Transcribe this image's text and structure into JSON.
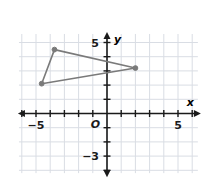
{
  "chart_data": {
    "type": "scatter",
    "title": "",
    "xlabel": "x",
    "ylabel": "y",
    "grid": true,
    "legend": false,
    "xlim": [
      -6.2,
      6.4
    ],
    "ylim": [
      -4.2,
      5.6
    ],
    "x_tick_labels": [
      {
        "value": -5,
        "text": "−5"
      },
      {
        "value": 5,
        "text": "5"
      }
    ],
    "y_tick_labels": [
      {
        "value": 5,
        "text": "5"
      },
      {
        "value": -3,
        "text": "−3"
      }
    ],
    "origin_label": "O",
    "shapes": [
      {
        "name": "triangle",
        "closed": true,
        "stroke": "#7a7a7a",
        "vertices": [
          {
            "x": -4.6,
            "y": 2.1
          },
          {
            "x": -3.7,
            "y": 4.5
          },
          {
            "x": 2.0,
            "y": 3.2
          }
        ]
      }
    ],
    "points": [
      {
        "x": -4.6,
        "y": 2.1
      },
      {
        "x": -3.7,
        "y": 4.5
      },
      {
        "x": 2.0,
        "y": 3.2
      }
    ]
  },
  "style": {
    "grid_color": "#d9dde4",
    "axis_color": "#1a1a1a",
    "shape_color": "#7a7a7a",
    "point_color": "#7a7a7a",
    "background": "#ffffff"
  }
}
